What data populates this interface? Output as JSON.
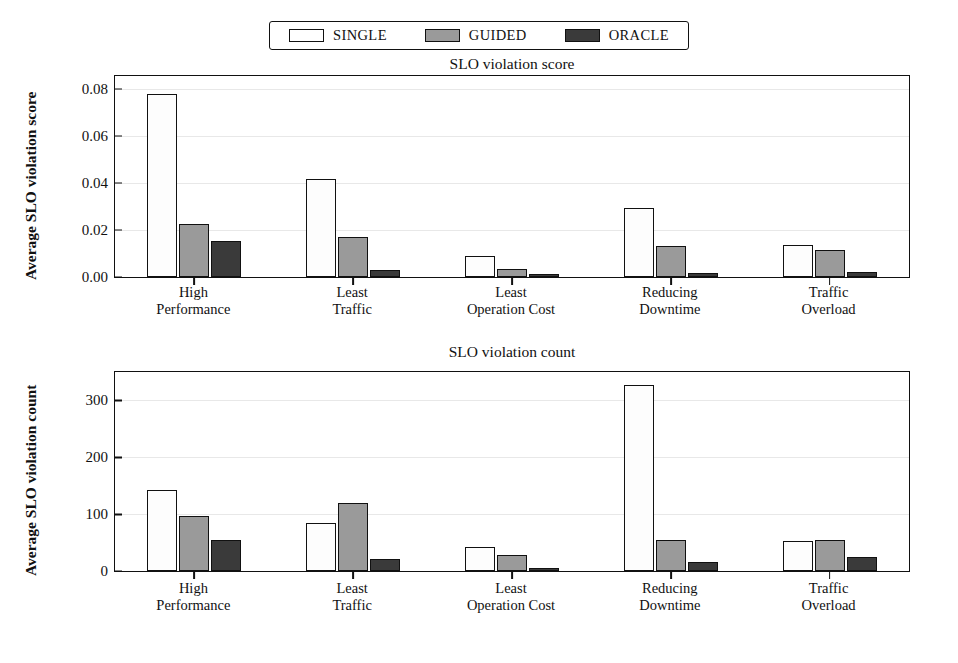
{
  "legend": {
    "position": "top-center",
    "items": [
      {
        "label": "SINGLE",
        "color": "#ffffff"
      },
      {
        "label": "GUIDED",
        "color": "#9a9a9a"
      },
      {
        "label": "ORACLE",
        "color": "#3a3a3a"
      }
    ]
  },
  "chart_data": [
    {
      "type": "bar",
      "title": "SLO violation score",
      "xlabel": "",
      "ylabel": "Average SLO violation score",
      "categories": [
        "High\nPerformance",
        "Least\nTraffic",
        "Least\nOperation Cost",
        "Reducing\nDowntime",
        "Traffic\nOverload"
      ],
      "category_lines": [
        [
          "High",
          "Performance"
        ],
        [
          "Least",
          "Traffic"
        ],
        [
          "Least",
          "Operation Cost"
        ],
        [
          "Reducing",
          "Downtime"
        ],
        [
          "Traffic",
          "Overload"
        ]
      ],
      "series": [
        {
          "name": "SINGLE",
          "color": "#ffffff",
          "values": [
            0.078,
            0.0418,
            0.009,
            0.0294,
            0.0135
          ]
        },
        {
          "name": "GUIDED",
          "color": "#9a9a9a",
          "values": [
            0.0224,
            0.017,
            0.0035,
            0.0133,
            0.0114
          ]
        },
        {
          "name": "ORACLE",
          "color": "#3a3a3a",
          "values": [
            0.0153,
            0.0028,
            0.0011,
            0.0018,
            0.0021
          ]
        }
      ],
      "ylim": [
        0.0,
        0.0855
      ],
      "yticks": [
        0.0,
        0.02,
        0.04,
        0.06,
        0.08
      ],
      "ytick_labels": [
        "0.00",
        "0.02",
        "0.04",
        "0.06",
        "0.08"
      ],
      "grid": true,
      "legend": "top"
    },
    {
      "type": "bar",
      "title": "SLO violation count",
      "xlabel": "",
      "ylabel": "Average SLO violation count",
      "categories": [
        "High\nPerformance",
        "Least\nTraffic",
        "Least\nOperation Cost",
        "Reducing\nDowntime",
        "Traffic\nOverload"
      ],
      "category_lines": [
        [
          "High",
          "Performance"
        ],
        [
          "Least",
          "Traffic"
        ],
        [
          "Least",
          "Operation Cost"
        ],
        [
          "Reducing",
          "Downtime"
        ],
        [
          "Traffic",
          "Overload"
        ]
      ],
      "series": [
        {
          "name": "SINGLE",
          "color": "#ffffff",
          "values": [
            143,
            85,
            43,
            327,
            53
          ]
        },
        {
          "name": "GUIDED",
          "color": "#9a9a9a",
          "values": [
            96,
            120,
            29,
            55,
            54
          ]
        },
        {
          "name": "ORACLE",
          "color": "#3a3a3a",
          "values": [
            54,
            21,
            5,
            15,
            25
          ]
        }
      ],
      "ylim": [
        0,
        350
      ],
      "yticks": [
        0,
        100,
        200,
        300
      ],
      "ytick_labels": [
        "0",
        "100",
        "200",
        "300"
      ],
      "grid": true,
      "legend": "top"
    }
  ]
}
